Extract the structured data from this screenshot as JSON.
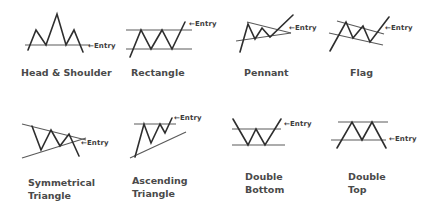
{
  "entry_label": "←Entry",
  "patterns": [
    {
      "name": "Head & Shoulder",
      "line1": "Head & Shoulder",
      "line2": ""
    },
    {
      "name": "Rectangle",
      "line1": "Rectangle",
      "line2": ""
    },
    {
      "name": "Pennant",
      "line1": "Pennant",
      "line2": ""
    },
    {
      "name": "Flag",
      "line1": "Flag",
      "line2": ""
    },
    {
      "name": "Symmetrical Triangle",
      "line1": "Symmetrical",
      "line2": "Triangle"
    },
    {
      "name": "Ascending Triangle",
      "line1": "Ascending",
      "line2": "Triangle"
    },
    {
      "name": "Double Bottom",
      "line1": "Double",
      "line2": "Bottom"
    },
    {
      "name": "Double Top",
      "line1": "Double",
      "line2": "Top"
    }
  ],
  "colors": {
    "stroke": "#2e2e2e",
    "text": "#4a4a4a",
    "background": "#ffffff"
  }
}
